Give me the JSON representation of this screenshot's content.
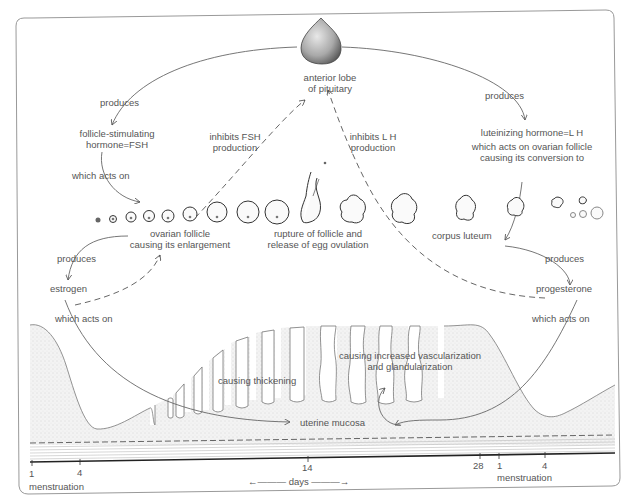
{
  "diagram": {
    "nodes": {
      "pituitary": {
        "line1": "anterior lobe",
        "line2": "of pituitary"
      },
      "fsh": {
        "line1": "follicle-stimulating",
        "line2": "hormone=FSH"
      },
      "lh": {
        "line1": "luteinizing hormone=L H",
        "line2": "which acts on ovarian follicle",
        "line3": "causing its conversion to"
      },
      "ovarian_follicle": {
        "line1": "ovarian follicle",
        "line2": "causing its enlargement"
      },
      "rupture": {
        "line1": "rupture of follicle and",
        "line2": "release of egg ovulation"
      },
      "corpus_luteum": {
        "label": "corpus luteum"
      },
      "estrogen": {
        "label": "estrogen"
      },
      "progesterone": {
        "label": "progesterone"
      },
      "uterine_mucosa": {
        "label": "uterine mucosa"
      },
      "thickening": {
        "label": "causing thickening"
      },
      "vascularization": {
        "line1": "causing increased vascularization",
        "line2": "and glandularization"
      }
    },
    "edges": {
      "produces_fsh": "produces",
      "produces_lh": "produces",
      "fsh_acts_on": "which acts on",
      "produces_estrogen": "produces",
      "produces_progesterone": "produces",
      "estrogen_acts_on": "which acts on",
      "progesterone_acts_on": "which acts on",
      "inhibits_fsh": {
        "line1": "inhibits FSH",
        "line2": "production"
      },
      "inhibits_lh": {
        "line1": "inhibits L H",
        "line2": "production"
      }
    },
    "timeline": {
      "ticks": [
        {
          "label": "1",
          "x": 32
        },
        {
          "label": "4",
          "x": 80
        },
        {
          "label": "14",
          "x": 308
        },
        {
          "label": "28",
          "x": 480
        },
        {
          "label": "1",
          "x": 499
        },
        {
          "label": "4",
          "x": 545
        }
      ],
      "menstruation_start": "menstruation",
      "menstruation_end": "menstruation",
      "days_label": "days",
      "days_arrow_left": "←———",
      "days_arrow_right": "———→"
    }
  }
}
